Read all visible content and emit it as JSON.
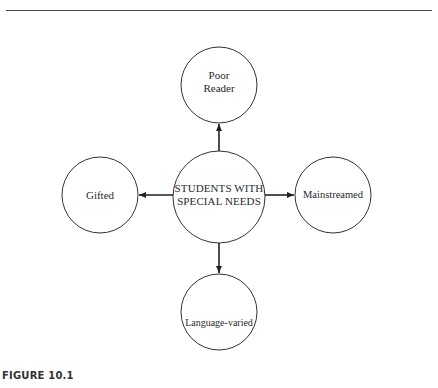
{
  "figure": {
    "caption": "FIGURE 10.1"
  },
  "diagram": {
    "center": {
      "label_line1": "STUDENTS WITH",
      "label_line2": "SPECIAL NEEDS"
    },
    "nodes": {
      "top": {
        "label_line1": "Poor",
        "label_line2": "Reader"
      },
      "left": {
        "label": "Gifted"
      },
      "right": {
        "label": "Mainstreamed"
      },
      "bottom": {
        "label": "Language-varied"
      }
    },
    "colors": {
      "stroke": "#333333",
      "background": "#ffffff"
    }
  }
}
